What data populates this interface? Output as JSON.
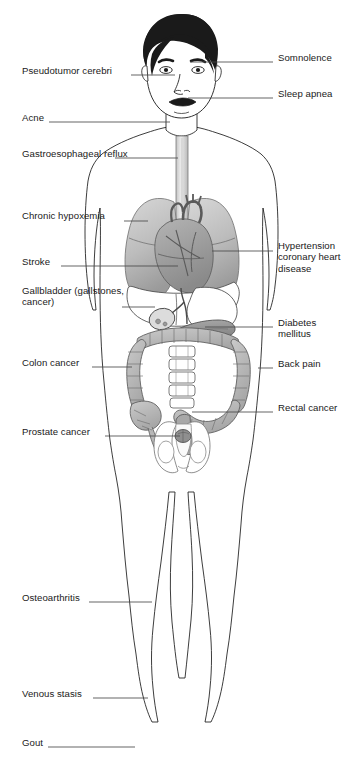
{
  "figure": {
    "background_color": "#ffffff",
    "line_color": "#1a1a1a",
    "leader_line_color": "#4a4a4a",
    "organ_fill_light": "#d0d0d0",
    "organ_fill_mid": "#b0b0b0",
    "organ_fill_dark": "#8f8f8f",
    "hair_color": "#1a1a1a",
    "skin_fill": "#ffffff"
  },
  "labels": {
    "left": [
      {
        "id": "pseudotumor-cerebri",
        "text": "Pseudotumor cerebri",
        "lines": [
          "Pseudotumor cerebri"
        ],
        "x": 22,
        "y": 71,
        "leader_from_x": 131,
        "leader_from_y": 75,
        "leader_to_x": 175,
        "leader_to_y": 75
      },
      {
        "id": "acne",
        "text": "Acne",
        "lines": [
          "Acne"
        ],
        "x": 22,
        "y": 118,
        "leader_from_x": 49,
        "leader_from_y": 122,
        "leader_to_x": 170,
        "leader_to_y": 122
      },
      {
        "id": "gastroesophageal-reflux",
        "text": "Gastroesophageal reflux",
        "lines": [
          "Gastroesophageal",
          "reflux"
        ],
        "x": 22,
        "y": 154,
        "leader_from_x": 115,
        "leader_from_y": 158,
        "leader_to_x": 178,
        "leader_to_y": 158
      },
      {
        "id": "chronic-hypoxemia",
        "text": "Chronic hypoxemia",
        "lines": [
          "Chronic hypoxemia"
        ],
        "x": 22,
        "y": 216,
        "leader_from_x": 124,
        "leader_from_y": 221,
        "leader_to_x": 148,
        "leader_to_y": 221
      },
      {
        "id": "stroke",
        "text": "Stroke",
        "lines": [
          "Stroke"
        ],
        "x": 22,
        "y": 262,
        "leader_from_x": 61,
        "leader_from_y": 266,
        "leader_to_x": 178,
        "leader_to_y": 266
      },
      {
        "id": "gallbladder",
        "text": "Gallbladder (gallstones, cancer)",
        "lines": [
          "Gallbladder",
          "(gallstones, cancer)"
        ],
        "x": 22,
        "y": 291,
        "leader_from_x": 122,
        "leader_from_y": 307,
        "leader_to_x": 155,
        "leader_to_y": 307
      },
      {
        "id": "colon-cancer",
        "text": "Colon cancer",
        "lines": [
          "Colon cancer"
        ],
        "x": 22,
        "y": 363,
        "leader_from_x": 92,
        "leader_from_y": 367,
        "leader_to_x": 132,
        "leader_to_y": 367
      },
      {
        "id": "prostate-cancer",
        "text": "Prostate cancer",
        "lines": [
          "Prostate cancer"
        ],
        "x": 22,
        "y": 432,
        "leader_from_x": 105,
        "leader_from_y": 436,
        "leader_to_x": 180,
        "leader_to_y": 436
      },
      {
        "id": "osteoarthritis",
        "text": "Osteoarthritis",
        "lines": [
          "Osteoarthritis"
        ],
        "x": 22,
        "y": 598,
        "leader_from_x": 89,
        "leader_from_y": 602,
        "leader_to_x": 152,
        "leader_to_y": 602
      },
      {
        "id": "venous-stasis",
        "text": "Venous stasis",
        "lines": [
          "Venous stasis"
        ],
        "x": 22,
        "y": 694,
        "leader_from_x": 93,
        "leader_from_y": 698,
        "leader_to_x": 148,
        "leader_to_y": 698
      },
      {
        "id": "gout",
        "text": "Gout",
        "lines": [
          "Gout"
        ],
        "x": 22,
        "y": 743,
        "leader_from_x": 48,
        "leader_from_y": 747,
        "leader_to_x": 135,
        "leader_to_y": 747
      }
    ],
    "right": [
      {
        "id": "somnolence",
        "text": "Somnolence",
        "lines": [
          "Somnolence"
        ],
        "x": 278,
        "y": 58,
        "leader_from_x": 273,
        "leader_from_y": 62,
        "leader_to_x": 190,
        "leader_to_y": 62
      },
      {
        "id": "sleep-apnea",
        "text": "Sleep apnea",
        "lines": [
          "Sleep apnea"
        ],
        "x": 278,
        "y": 94,
        "leader_from_x": 273,
        "leader_from_y": 98,
        "leader_to_x": 188,
        "leader_to_y": 98
      },
      {
        "id": "hypertension-coronary-heart-disease",
        "text": "Hypertension coronary heart disease",
        "lines": [
          "Hypertension",
          "coronary heart",
          "disease"
        ],
        "x": 278,
        "y": 246,
        "leader_from_x": 273,
        "leader_from_y": 251,
        "leader_to_x": 212,
        "leader_to_y": 251
      },
      {
        "id": "diabetes-mellitus",
        "text": "Diabetes mellitus",
        "lines": [
          "Diabetes",
          "mellitus"
        ],
        "x": 278,
        "y": 323,
        "leader_from_x": 273,
        "leader_from_y": 327,
        "leader_to_x": 205,
        "leader_to_y": 327
      },
      {
        "id": "back-pain",
        "text": "Back pain",
        "lines": [
          "Back pain"
        ],
        "x": 278,
        "y": 364,
        "leader_from_x": 273,
        "leader_from_y": 368,
        "leader_to_x": 258,
        "leader_to_y": 368
      },
      {
        "id": "rectal-cancer",
        "text": "Rectal cancer",
        "lines": [
          "Rectal cancer"
        ],
        "x": 278,
        "y": 408,
        "leader_from_x": 273,
        "leader_from_y": 412,
        "leader_to_x": 192,
        "leader_to_y": 412
      }
    ]
  },
  "anatomy_parts": [
    "hair",
    "face",
    "eyes",
    "eyebrows",
    "nose",
    "mouth",
    "neck",
    "esophagus",
    "left-lung",
    "right-lung",
    "heart",
    "liver",
    "gallbladder",
    "stomach",
    "pancreas",
    "ascending-colon",
    "transverse-colon",
    "descending-colon",
    "sigmoid-colon",
    "rectum",
    "appendix",
    "lumbar-spine",
    "pelvis",
    "prostate",
    "arms",
    "legs",
    "feet"
  ]
}
